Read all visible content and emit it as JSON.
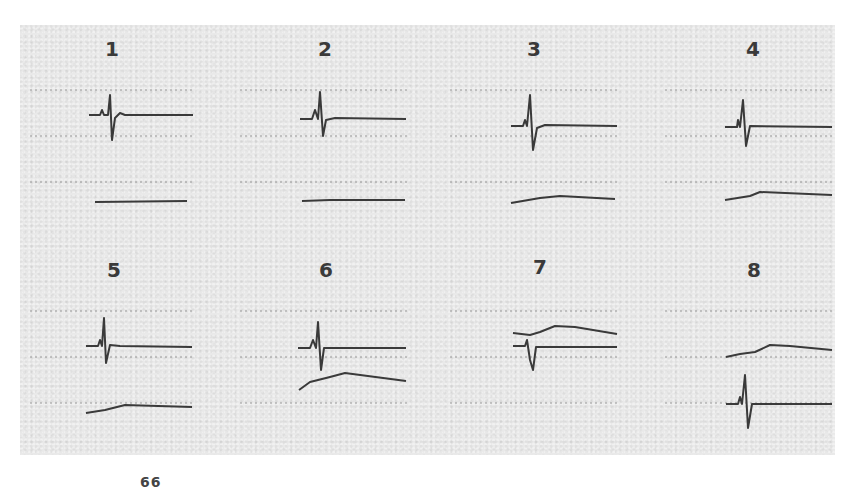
{
  "figure": {
    "panels": [
      {
        "label": "1"
      },
      {
        "label": "2"
      },
      {
        "label": "3"
      },
      {
        "label": "4"
      },
      {
        "label": "5"
      },
      {
        "label": "6"
      },
      {
        "label": "7"
      },
      {
        "label": "8"
      }
    ],
    "footer_mark": "66"
  },
  "colors": {
    "background": "#ffffff",
    "plate": "#e9e9e9",
    "trace": "#3a3a3a",
    "grid": "#9a9a9a"
  }
}
